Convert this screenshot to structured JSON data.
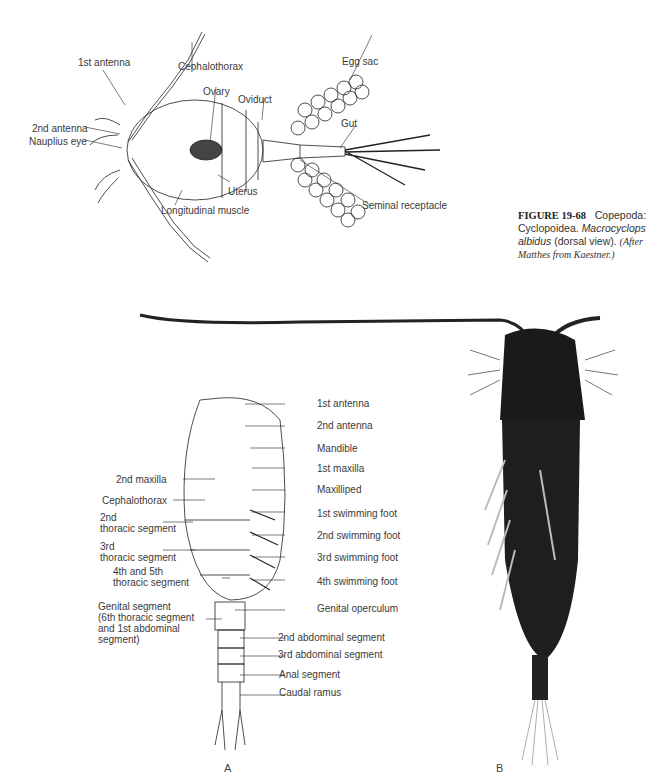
{
  "figure": {
    "number": "FIGURE 19-68",
    "title": "Copepoda: Cyclopoidea.",
    "species": "Macrocyclops albidus",
    "view": "(dorsal view).",
    "credit": "(After Matthes from Kaestner.)"
  },
  "top_diagram": {
    "labels": {
      "first_antenna": "1st antenna",
      "cephalothorax": "Cephalothorax",
      "ovary": "Ovary",
      "oviduct": "Oviduct",
      "egg_sac": "Egg sac",
      "gut": "Gut",
      "second_antenna": "2nd antenna",
      "nauplius_eye": "Nauplius eye",
      "uterus": "Uterus",
      "longitudinal_muscle": "Longitudinal muscle",
      "seminal_receptacle": "Seminal receptacle"
    }
  },
  "panel_a": {
    "panel_label": "A",
    "right_labels": [
      "1st antenna",
      "2nd antenna",
      "Mandible",
      "1st maxilla",
      "Maxilliped",
      "1st swimming foot",
      "2nd swimming foot",
      "3rd swimming foot",
      "4th swimming foot",
      "Genital operculum",
      "2nd abdominal segment",
      "3rd abdominal segment",
      "Anal segment",
      "Caudal ramus"
    ],
    "left_labels": {
      "second_maxilla": "2nd maxilla",
      "cephalothorax": "Cephalothorax",
      "second_thoracic_1": "2nd",
      "second_thoracic_2": "thoracic segment",
      "third_thoracic_1": "3rd",
      "third_thoracic_2": "thoracic segment",
      "fourth_fifth_1": "4th and 5th",
      "fourth_fifth_2": "thoracic segment",
      "genital_1": "Genital segment",
      "genital_2": "(6th thoracic segment",
      "genital_3": "and 1st abdominal",
      "genital_4": "segment)"
    }
  },
  "panel_b": {
    "panel_label": "B"
  }
}
